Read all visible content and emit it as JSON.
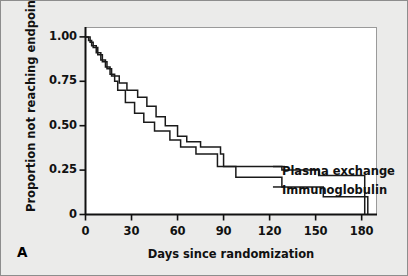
{
  "figure": {
    "panel_letter": "A",
    "background_color": "#ebebea",
    "plot_background_color": "#ffffff",
    "border_color": "#8d8d8d"
  },
  "chart_data": {
    "type": "line",
    "subtype": "kaplan-meier-step",
    "title": "",
    "xlabel": "Days since randomization",
    "ylabel": "Proportion not reaching endpoint",
    "xlim": [
      0,
      190
    ],
    "ylim": [
      0,
      1.05
    ],
    "xticks": [
      0,
      30,
      60,
      90,
      120,
      150,
      180
    ],
    "xtick_labels": [
      "0",
      "30",
      "60",
      "90",
      "120",
      "150",
      "180"
    ],
    "yticks": [
      0,
      0.25,
      0.5,
      0.75,
      1.0
    ],
    "ytick_labels": [
      "0",
      "0.25",
      "0.50",
      "0.75",
      "1.00"
    ],
    "grid": false,
    "legend_position": "inline-right",
    "line_color": "#1a1a1a",
    "series": [
      {
        "name": "Plasma exchange",
        "label_x": 130,
        "label_y": 0.27,
        "steps": [
          {
            "x": 0,
            "y": 1.0
          },
          {
            "x": 3,
            "y": 0.97
          },
          {
            "x": 5,
            "y": 0.94
          },
          {
            "x": 8,
            "y": 0.9
          },
          {
            "x": 11,
            "y": 0.86
          },
          {
            "x": 14,
            "y": 0.82
          },
          {
            "x": 17,
            "y": 0.78
          },
          {
            "x": 22,
            "y": 0.74
          },
          {
            "x": 27,
            "y": 0.7
          },
          {
            "x": 34,
            "y": 0.66
          },
          {
            "x": 40,
            "y": 0.61
          },
          {
            "x": 46,
            "y": 0.55
          },
          {
            "x": 52,
            "y": 0.5
          },
          {
            "x": 60,
            "y": 0.44
          },
          {
            "x": 66,
            "y": 0.41
          },
          {
            "x": 75,
            "y": 0.38
          },
          {
            "x": 88,
            "y": 0.34
          },
          {
            "x": 90,
            "y": 0.27
          },
          {
            "x": 128,
            "y": 0.25
          },
          {
            "x": 152,
            "y": 0.22
          },
          {
            "x": 182,
            "y": 0.22
          }
        ]
      },
      {
        "name": "Immunoglobulin",
        "label_x": 130,
        "label_y": 0.155,
        "steps": [
          {
            "x": 0,
            "y": 1.0
          },
          {
            "x": 2,
            "y": 0.98
          },
          {
            "x": 4,
            "y": 0.95
          },
          {
            "x": 7,
            "y": 0.91
          },
          {
            "x": 10,
            "y": 0.87
          },
          {
            "x": 13,
            "y": 0.83
          },
          {
            "x": 16,
            "y": 0.79
          },
          {
            "x": 19,
            "y": 0.75
          },
          {
            "x": 21,
            "y": 0.7
          },
          {
            "x": 26,
            "y": 0.63
          },
          {
            "x": 32,
            "y": 0.57
          },
          {
            "x": 38,
            "y": 0.52
          },
          {
            "x": 45,
            "y": 0.47
          },
          {
            "x": 55,
            "y": 0.42
          },
          {
            "x": 62,
            "y": 0.38
          },
          {
            "x": 72,
            "y": 0.34
          },
          {
            "x": 86,
            "y": 0.27
          },
          {
            "x": 98,
            "y": 0.21
          },
          {
            "x": 128,
            "y": 0.155
          },
          {
            "x": 155,
            "y": 0.1
          },
          {
            "x": 184,
            "y": 0.1
          }
        ]
      }
    ]
  }
}
